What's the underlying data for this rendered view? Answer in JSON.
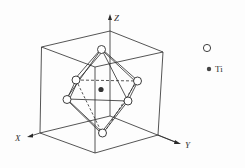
{
  "figure": {
    "axes": {
      "x": "X",
      "y": "Y",
      "z": "Z"
    },
    "legend": [
      {
        "symbol": "open-circle",
        "label": ""
      },
      {
        "symbol": "filled-circle",
        "label": "Ti"
      }
    ],
    "colors": {
      "line": "#2a2a2a",
      "ti": "#333333",
      "atom_fill": "#ffffff"
    }
  }
}
